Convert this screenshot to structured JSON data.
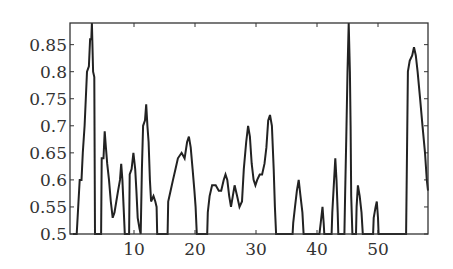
{
  "chart_data": {
    "type": "line",
    "title": "",
    "xlabel": "",
    "ylabel": "",
    "xlim": [
      -0.5,
      58.2
    ],
    "ylim": [
      0.5,
      0.89
    ],
    "grid": false,
    "legend": null,
    "x_ticks": [
      10,
      20,
      30,
      40,
      50
    ],
    "x_tick_labels": [
      "10",
      "20",
      "30",
      "40",
      "50"
    ],
    "y_ticks": [
      0.5,
      0.55,
      0.6,
      0.65,
      0.7,
      0.75,
      0.8,
      0.85
    ],
    "y_tick_labels": [
      "0.5",
      "0.55",
      "0.6",
      "0.65",
      "0.7",
      "0.75",
      "0.8",
      "0.85"
    ],
    "line_color": "#222222",
    "series": [
      {
        "name": "series-1",
        "points": [
          [
            0.0,
            0.5
          ],
          [
            0.6,
            0.5
          ],
          [
            0.7,
            0.52
          ],
          [
            0.9,
            0.56
          ],
          [
            1.1,
            0.6
          ],
          [
            1.4,
            0.6
          ],
          [
            1.6,
            0.65
          ],
          [
            1.9,
            0.7
          ],
          [
            2.1,
            0.75
          ],
          [
            2.3,
            0.8
          ],
          [
            2.6,
            0.81
          ],
          [
            2.8,
            0.86
          ],
          [
            3.0,
            0.86
          ],
          [
            3.1,
            0.89
          ],
          [
            3.3,
            0.8
          ],
          [
            3.5,
            0.79
          ],
          [
            3.6,
            0.5
          ],
          [
            4.6,
            0.5
          ],
          [
            4.7,
            0.64
          ],
          [
            5.0,
            0.64
          ],
          [
            5.2,
            0.69
          ],
          [
            5.4,
            0.66
          ],
          [
            5.6,
            0.63
          ],
          [
            5.9,
            0.6
          ],
          [
            6.2,
            0.56
          ],
          [
            6.5,
            0.53
          ],
          [
            6.8,
            0.54
          ],
          [
            7.1,
            0.56
          ],
          [
            7.4,
            0.58
          ],
          [
            7.7,
            0.6
          ],
          [
            7.9,
            0.63
          ],
          [
            8.1,
            0.6
          ],
          [
            8.3,
            0.55
          ],
          [
            8.5,
            0.5
          ],
          [
            9.2,
            0.5
          ],
          [
            9.3,
            0.61
          ],
          [
            9.6,
            0.62
          ],
          [
            9.9,
            0.65
          ],
          [
            10.2,
            0.62
          ],
          [
            10.4,
            0.58
          ],
          [
            10.6,
            0.53
          ],
          [
            10.9,
            0.51
          ],
          [
            11.1,
            0.5
          ],
          [
            11.3,
            0.62
          ],
          [
            11.5,
            0.7
          ],
          [
            11.8,
            0.71
          ],
          [
            12.0,
            0.74
          ],
          [
            12.2,
            0.7
          ],
          [
            12.4,
            0.67
          ],
          [
            12.6,
            0.6
          ],
          [
            12.8,
            0.56
          ],
          [
            13.2,
            0.57
          ],
          [
            13.5,
            0.56
          ],
          [
            13.7,
            0.55
          ],
          [
            13.8,
            0.5
          ],
          [
            15.5,
            0.5
          ],
          [
            15.6,
            0.56
          ],
          [
            16.0,
            0.58
          ],
          [
            16.4,
            0.6
          ],
          [
            16.8,
            0.62
          ],
          [
            17.2,
            0.64
          ],
          [
            17.8,
            0.65
          ],
          [
            18.3,
            0.64
          ],
          [
            18.7,
            0.67
          ],
          [
            19.0,
            0.68
          ],
          [
            19.3,
            0.66
          ],
          [
            19.6,
            0.62
          ],
          [
            19.9,
            0.58
          ],
          [
            20.1,
            0.55
          ],
          [
            20.3,
            0.5
          ],
          [
            22.0,
            0.5
          ],
          [
            22.1,
            0.54
          ],
          [
            22.4,
            0.57
          ],
          [
            22.8,
            0.59
          ],
          [
            23.4,
            0.59
          ],
          [
            23.9,
            0.58
          ],
          [
            24.3,
            0.58
          ],
          [
            24.7,
            0.6
          ],
          [
            25.0,
            0.61
          ],
          [
            25.3,
            0.6
          ],
          [
            25.6,
            0.57
          ],
          [
            25.9,
            0.55
          ],
          [
            26.2,
            0.57
          ],
          [
            26.5,
            0.59
          ],
          [
            26.9,
            0.57
          ],
          [
            27.3,
            0.55
          ],
          [
            27.7,
            0.56
          ],
          [
            28.0,
            0.62
          ],
          [
            28.4,
            0.67
          ],
          [
            28.7,
            0.7
          ],
          [
            29.0,
            0.68
          ],
          [
            29.3,
            0.63
          ],
          [
            29.6,
            0.6
          ],
          [
            29.9,
            0.59
          ],
          [
            30.2,
            0.6
          ],
          [
            30.6,
            0.61
          ],
          [
            31.0,
            0.61
          ],
          [
            31.4,
            0.63
          ],
          [
            31.7,
            0.66
          ],
          [
            32.0,
            0.71
          ],
          [
            32.3,
            0.72
          ],
          [
            32.6,
            0.7
          ],
          [
            32.9,
            0.62
          ],
          [
            33.1,
            0.55
          ],
          [
            33.3,
            0.5
          ],
          [
            36.0,
            0.5
          ],
          [
            36.1,
            0.52
          ],
          [
            36.4,
            0.55
          ],
          [
            36.7,
            0.58
          ],
          [
            37.0,
            0.6
          ],
          [
            37.3,
            0.57
          ],
          [
            37.6,
            0.54
          ],
          [
            37.8,
            0.5
          ],
          [
            40.4,
            0.5
          ],
          [
            40.6,
            0.52
          ],
          [
            40.9,
            0.55
          ],
          [
            41.1,
            0.52
          ],
          [
            41.2,
            0.5
          ],
          [
            42.4,
            0.5
          ],
          [
            42.5,
            0.54
          ],
          [
            42.8,
            0.6
          ],
          [
            43.0,
            0.64
          ],
          [
            43.2,
            0.6
          ],
          [
            43.4,
            0.54
          ],
          [
            43.5,
            0.5
          ],
          [
            44.5,
            0.5
          ],
          [
            44.6,
            0.57
          ],
          [
            44.8,
            0.68
          ],
          [
            45.0,
            0.8
          ],
          [
            45.2,
            0.89
          ],
          [
            45.4,
            0.8
          ],
          [
            45.5,
            0.7
          ],
          [
            45.6,
            0.57
          ],
          [
            45.8,
            0.5
          ],
          [
            46.4,
            0.5
          ],
          [
            46.5,
            0.55
          ],
          [
            46.7,
            0.59
          ],
          [
            47.0,
            0.57
          ],
          [
            47.3,
            0.54
          ],
          [
            47.5,
            0.5
          ],
          [
            49.2,
            0.5
          ],
          [
            49.3,
            0.53
          ],
          [
            49.6,
            0.55
          ],
          [
            49.8,
            0.56
          ],
          [
            50.0,
            0.53
          ],
          [
            50.1,
            0.5
          ],
          [
            54.6,
            0.5
          ],
          [
            54.7,
            0.6
          ],
          [
            54.9,
            0.8
          ],
          [
            55.2,
            0.82
          ],
          [
            55.6,
            0.83
          ],
          [
            55.9,
            0.845
          ],
          [
            56.2,
            0.83
          ],
          [
            56.5,
            0.8
          ],
          [
            56.9,
            0.75
          ],
          [
            57.3,
            0.7
          ],
          [
            57.7,
            0.65
          ],
          [
            58.0,
            0.6
          ],
          [
            58.2,
            0.58
          ]
        ]
      }
    ]
  }
}
